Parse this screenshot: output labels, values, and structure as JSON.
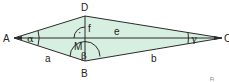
{
  "diagram": {
    "type": "kite",
    "colors": {
      "fill": "#d7efe0",
      "stroke": "#2a2a2a",
      "background": "#ffffff"
    },
    "vertices": {
      "A": {
        "label": "A",
        "x": 14,
        "y": 38
      },
      "B": {
        "label": "B",
        "x": 85,
        "y": 61
      },
      "C": {
        "label": "C",
        "x": 222,
        "y": 38
      },
      "D": {
        "label": "D",
        "x": 85,
        "y": 16
      }
    },
    "center": {
      "label": "M"
    },
    "diagonals": {
      "e": "e",
      "f": "f"
    },
    "sides": {
      "a": "a",
      "b": "b"
    },
    "angles": {
      "alpha": "α",
      "beta": "β",
      "gamma": "γ"
    },
    "right_angle_marker": "·",
    "footer_mark": "Fi"
  }
}
